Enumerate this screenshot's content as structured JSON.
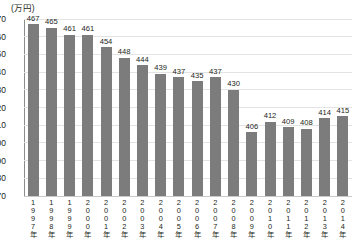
{
  "chart_data": {
    "type": "bar",
    "title": "",
    "subtitle": "",
    "unit_label": "(万円)",
    "xlabel": "",
    "ylabel": "",
    "ylim": [
      370,
      470
    ],
    "yticks": [
      370,
      380,
      390,
      400,
      410,
      420,
      430,
      440,
      450,
      460,
      470
    ],
    "grid": true,
    "legend": null,
    "bar_color": "#7c7c7c",
    "gridline_color": "#e3e3e3",
    "axis_color": "#8c8c8c",
    "text_color": "#231f20",
    "categories": [
      "1997年",
      "1998年",
      "1999年",
      "2000年",
      "2001年",
      "2002年",
      "2003年",
      "2004年",
      "2005年",
      "2006年",
      "2007年",
      "2008年",
      "2009年",
      "2010年",
      "2011年",
      "2012年",
      "2013年",
      "2014年"
    ],
    "values": [
      467,
      465,
      461,
      461,
      454,
      448,
      444,
      439,
      437,
      435,
      437,
      430,
      406,
      412,
      409,
      408,
      414,
      415
    ],
    "data_labels": [
      "467",
      "465",
      "461",
      "461",
      "454",
      "448",
      "444",
      "439",
      "437",
      "435",
      "437",
      "430",
      "406",
      "412",
      "409",
      "408",
      "414",
      "415"
    ]
  }
}
